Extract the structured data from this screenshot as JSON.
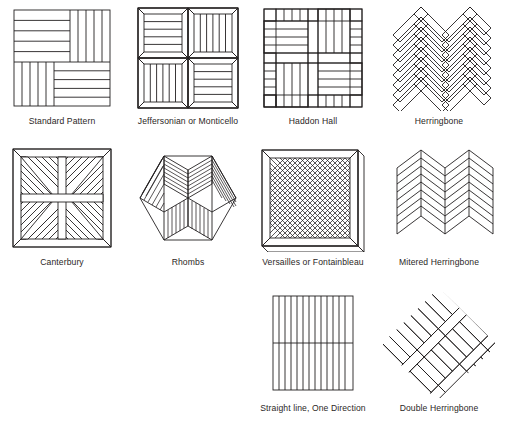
{
  "figure": {
    "background_color": "#ffffff",
    "line_color": "#231f20",
    "caption_color": "#2b2726",
    "columns": 4,
    "rows": 3
  },
  "patterns": [
    {
      "id": "standard-pattern",
      "label": "Standard Pattern",
      "motif": "parquet-square-basket-2x2",
      "row": 0,
      "column": 0,
      "description": "Square divided into four blocks of parallel planks, alternating horizontal and vertical.",
      "plank_counts": {
        "top_left": 5,
        "top_right": 5,
        "bottom_left": 5,
        "bottom_right": 5
      }
    },
    {
      "id": "jeffersonian-or-monticello",
      "label": "Jeffersonian or Monticello",
      "motif": "four-mitered-frame-squares",
      "row": 0,
      "column": 1,
      "description": "Four mitered-border squares; planks inside alternate horizontal and vertical.",
      "plank_counts": {
        "top_left": 5,
        "top_right": 6,
        "bottom_left": 6,
        "bottom_right": 5
      }
    },
    {
      "id": "haddon-hall",
      "label": "Haddon Hall",
      "motif": "basket-weave-with-border-planks",
      "row": 0,
      "column": 2,
      "description": "Basket weave of bordered blocks, each block four planks wide, alternating direction.",
      "blocks": 4,
      "planks_per_block": 4
    },
    {
      "id": "herringbone",
      "label": "Herringbone",
      "motif": "herringbone-chevron",
      "row": 0,
      "column": 3,
      "description": "Rectangular planks laid at 45 degrees in interlocking zig-zag chevrons.",
      "chevron_rows": 7
    },
    {
      "id": "canterbury",
      "label": "Canterbury",
      "motif": "diagonal-star-quadrants",
      "row": 1,
      "column": 0,
      "description": "Four quadrants with diagonal plank bands forming a central star.",
      "quadrants": 4
    },
    {
      "id": "rhombs",
      "label": "Rhombs",
      "motif": "hexagon-of-six-rhombi",
      "row": 1,
      "column": 1,
      "description": "Hexagon composed of six rhombi of parallel planks, giving a tumbling-block effect.",
      "rhombi": 6
    },
    {
      "id": "versailles-or-fontainbleau",
      "label": "Versailles or Fontainbleau",
      "motif": "mitered-frame-with-diagonal-lattice",
      "row": 1,
      "column": 2,
      "description": "Mitered square border enclosing an interwoven diagonal lattice of planks.",
      "lattice_lines": 10
    },
    {
      "id": "mitered-herringbone",
      "label": "Mitered Herringbone",
      "motif": "continuous-mitered-chevron",
      "row": 1,
      "column": 3,
      "description": "Chevrons whose plank ends are mitered so the rows meet in unbroken V shapes.",
      "chevron_rows": 9,
      "chevron_columns": 2
    },
    {
      "id": "straight-line-one-direction",
      "label": "Straight line, One Direction",
      "motif": "straight-parallel-planks",
      "row": 2,
      "column": 2,
      "description": "Parallel planks running one direction with a single end joint across the middle.",
      "plank_count": 13,
      "joint_rows": 1
    },
    {
      "id": "double-herringbone",
      "label": "Double Herringbone",
      "motif": "diagonal-double-herringbone",
      "row": 2,
      "column": 3,
      "description": "Herringbone rotated 45 degrees using double-width planks.",
      "chevron_rows": 5
    }
  ]
}
